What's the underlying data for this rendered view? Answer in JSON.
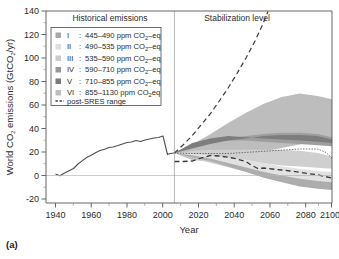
{
  "figure": {
    "panel_label": "(a)",
    "background": "#ffffff"
  },
  "annotations": {
    "historical": "Historical emissions",
    "stabilization": "Stabilization level",
    "divider_year": 2000
  },
  "axes": {
    "x": {
      "title": "Year",
      "ticks": [
        1940,
        1960,
        1980,
        2000,
        2020,
        2040,
        2060,
        2080,
        2100
      ],
      "minor_step": 10,
      "range": [
        1935,
        2105
      ]
    },
    "y": {
      "title_parts": {
        "pre": "World CO",
        "sub1": "2",
        "mid": " emissions (GtCO",
        "sub2": "2",
        "post": "/yr)"
      },
      "title": "World CO2 emissions (GtCO2/yr)",
      "ticks": [
        -20,
        0,
        20,
        40,
        60,
        80,
        100,
        120,
        140
      ],
      "minor_step": 10,
      "range": [
        -25,
        145
      ]
    }
  },
  "legend": {
    "items": [
      {
        "roman": "I",
        "sep": ":",
        "label": "445–490 ppm CO",
        "sub": "2",
        "suffix": "–eq",
        "color": "#a8a8a8"
      },
      {
        "roman": "II",
        "sep": ":",
        "label": "490–535 ppm CO",
        "sub": "2",
        "suffix": "–eq",
        "color": "#dedede"
      },
      {
        "roman": "III",
        "sep": ":",
        "label": "535–590 ppm CO",
        "sub": "2",
        "suffix": "–eq",
        "color": "#cacaca"
      },
      {
        "roman": "IV",
        "sep": ":",
        "label": "590–710 ppm CO",
        "sub": "2",
        "suffix": "–eq",
        "color": "#989898"
      },
      {
        "roman": "V",
        "sep": ":",
        "label": "710–855 ppm CO",
        "sub": "2",
        "suffix": "–eq",
        "color": "#7a7a7a"
      },
      {
        "roman": "VI",
        "sep": ":",
        "label": "855–1130 ppm CO",
        "sub": "2",
        "suffix": "eq",
        "color": "#bdbdbd"
      }
    ],
    "post_sres": {
      "label": "post-SRES range",
      "style": "dashed",
      "color": "#3a3a3a"
    }
  },
  "chart_data": {
    "type": "area",
    "title": "",
    "xlabel": "Year",
    "ylabel": "World CO2 emissions (GtCO2/yr)",
    "xlim": [
      1935,
      2105
    ],
    "ylim": [
      -25,
      145
    ],
    "grid": false,
    "legend_position": "upper-left-inside",
    "series": [
      {
        "name": "Historical emissions",
        "type": "line",
        "color": "#555555",
        "x": [
          1940,
          1945,
          1950,
          1955,
          1960,
          1965,
          1970,
          1975,
          1980,
          1985,
          1990,
          1995,
          2000
        ],
        "values": [
          8.0,
          7.4,
          9.0,
          11.0,
          13.0,
          15.5,
          18.5,
          20.0,
          22.5,
          23.0,
          25.5,
          26.5,
          28.5
        ]
      },
      {
        "name": "VI: 855–1130 ppm CO2eq (outer band)",
        "type": "band",
        "color": "#bdbdbd",
        "x": [
          2000,
          2010,
          2020,
          2030,
          2040,
          2050,
          2060,
          2070,
          2080,
          2090,
          2100
        ],
        "upper": [
          28.5,
          36,
          45,
          55,
          64,
          72,
          78,
          81,
          79,
          77,
          75
        ],
        "lower": [
          28.5,
          24,
          20,
          16,
          12,
          8,
          4,
          0,
          -3,
          -6,
          -8
        ]
      },
      {
        "name": "IV: 590–710 ppm CO2-eq",
        "type": "band",
        "color": "#989898",
        "x": [
          2000,
          2010,
          2020,
          2030,
          2040,
          2050,
          2060,
          2070,
          2080,
          2090,
          2100
        ],
        "upper": [
          28.5,
          33,
          38,
          41,
          43,
          45,
          46,
          46,
          45,
          42,
          39
        ],
        "lower": [
          28.5,
          28,
          27,
          26,
          26,
          27,
          29,
          31,
          32,
          32,
          31
        ]
      },
      {
        "name": "V: 710–855 ppm CO2-eq",
        "type": "band",
        "color": "#7a7a7a",
        "x": [
          2000,
          2010,
          2020,
          2030,
          2040,
          2050,
          2060,
          2070,
          2080,
          2090,
          2100
        ],
        "upper": [
          28.5,
          32,
          36,
          39,
          41,
          43,
          44,
          44,
          43,
          40,
          37
        ],
        "lower": [
          28.5,
          29,
          30,
          31,
          32,
          33,
          35,
          36,
          37,
          36,
          34
        ]
      },
      {
        "name": "III: 535–590 ppm CO2-eq",
        "type": "band",
        "color": "#cacaca",
        "x": [
          2000,
          2010,
          2020,
          2030,
          2040,
          2050,
          2060,
          2070,
          2080,
          2090,
          2100
        ],
        "upper": [
          28.5,
          30,
          31,
          31,
          31,
          31,
          31,
          30,
          28,
          25,
          22
        ],
        "lower": [
          28.5,
          26,
          24,
          22,
          20,
          18,
          16,
          14,
          13,
          12,
          11
        ]
      },
      {
        "name": "II: 490–535 ppm CO2-eq",
        "type": "band",
        "color": "#dedede",
        "x": [
          2000,
          2010,
          2020,
          2030,
          2040,
          2050,
          2060,
          2070,
          2080,
          2090,
          2100
        ],
        "upper": [
          28.5,
          27,
          26,
          24,
          22,
          19,
          16,
          14,
          12,
          11,
          10
        ],
        "lower": [
          28.5,
          24,
          21,
          17,
          13,
          9,
          6,
          3,
          1,
          0,
          -1
        ]
      },
      {
        "name": "I: 445–490 ppm CO2-eq",
        "type": "band",
        "color": "#a8a8a8",
        "x": [
          2000,
          2010,
          2020,
          2030,
          2040,
          2050,
          2060,
          2070,
          2080,
          2090,
          2100
        ],
        "upper": [
          28.5,
          26,
          23,
          19,
          15,
          11,
          8,
          5,
          3,
          2,
          1
        ],
        "lower": [
          28.5,
          23,
          19,
          14,
          9,
          5,
          2,
          -1,
          -3,
          -5,
          -6
        ]
      },
      {
        "name": "post-SRES range (upper)",
        "type": "dashed-line",
        "color": "#3a3a3a",
        "x": [
          2000,
          2010,
          2020,
          2030,
          2040,
          2050
        ],
        "values": [
          28.5,
          44,
          62,
          85,
          112,
          142
        ]
      },
      {
        "name": "post-SRES range (lower)",
        "type": "dashed-line",
        "color": "#3a3a3a",
        "x": [
          2000,
          2010,
          2020,
          2030,
          2040,
          2050,
          2060,
          2070,
          2080,
          2090,
          2100
        ],
        "values": [
          21,
          21,
          23,
          22,
          20,
          18,
          14,
          13,
          12,
          11,
          10
        ]
      },
      {
        "name": "median trajectory (dotted)",
        "type": "dotted-line",
        "color": "#4a4a4a",
        "x": [
          2000,
          2010,
          2020,
          2030,
          2040,
          2050,
          2060,
          2070,
          2080,
          2090,
          2100
        ],
        "values": [
          28.5,
          28,
          28,
          28,
          29,
          30,
          31,
          32,
          32,
          29,
          24
        ]
      }
    ]
  }
}
